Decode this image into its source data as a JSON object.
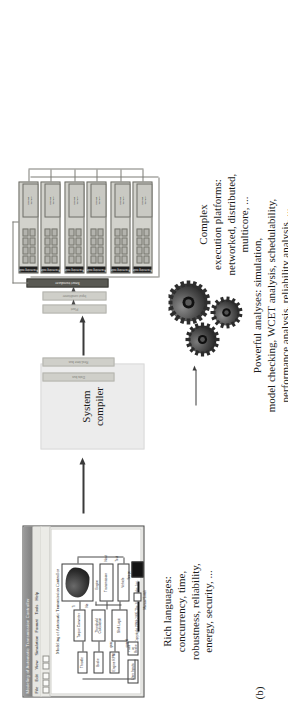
{
  "figure": {
    "caption": "(b)",
    "notes": {
      "languages": "Rich languages:\nconcurrency, time,\nrobustness, reliability,\nenergy, security, ...",
      "platforms": "Complex\nexecution platforms:\nnetworked, distributed,\nmulticore, ...",
      "analyses": "Powerful analyses: simulation,\nmodel checking, WCET analysis, schedulability,\nperformance analysis, reliability analysis, ..."
    },
    "compiler": {
      "label": "System\ncompiler"
    },
    "arrows": {
      "model_to_compiler": "arrow-right",
      "compiler_to_platform": "arrow-right",
      "compiler_to_gears": "arrow-right"
    }
  },
  "model_window": {
    "title": "Modeling of Automatic Transmission Controller",
    "menus": [
      "File",
      "Edit",
      "View",
      "Simulation",
      "Format",
      "Tools",
      "Help"
    ],
    "model_title": "Modeling of Automatic Transmission Controller",
    "footer": "Copyright 1990-2005 The MathWorks, Inc.",
    "blocks": [
      {
        "label": "Engine RPM"
      },
      {
        "label": "Throttle"
      },
      {
        "label": "Brake"
      },
      {
        "label": "Engine"
      },
      {
        "label": "Torque Converter"
      },
      {
        "label": "Transmission"
      },
      {
        "label": "Vehicle"
      },
      {
        "label": "Shift Logic"
      },
      {
        "label": "Threshold Calculation"
      },
      {
        "label": "Gear"
      },
      {
        "label": "Speed"
      },
      {
        "label": "Output Shaft"
      },
      {
        "label": "Impeller torque"
      },
      {
        "label": "Vehicle Speed"
      },
      {
        "label": "Manual Switch"
      },
      {
        "label": "Scope"
      },
      {
        "label": "Pass or Brake"
      },
      {
        "label": "User Inputs"
      }
    ],
    "annotations": [
      "Ti",
      "Ne",
      "Nout",
      "Tout",
      "gear",
      "speed"
    ]
  },
  "platform": {
    "side_bars": [
      {
        "label": "Plant",
        "style": "light"
      },
      {
        "label": "Input conditioner",
        "style": "light"
      },
      {
        "label": "Smart transducer",
        "style": "dark"
      }
    ],
    "right_bars": [
      {
        "label": "Data bus",
        "style": "light"
      },
      {
        "label": "Real-time bus",
        "style": "light"
      }
    ],
    "nodes": [
      {
        "label": "Processing node"
      },
      {
        "label": "Processing node"
      },
      {
        "label": "Processing node"
      },
      {
        "label": "Processing node"
      },
      {
        "label": "Processing node"
      },
      {
        "label": "Processing node"
      },
      {
        "label": "Processing node"
      },
      {
        "label": "Processing node"
      }
    ],
    "memory_label": "Shared\nmemory"
  },
  "colors": {
    "background": "#ffffff",
    "text": "#1b1b1b",
    "compiler_fill": "#ececec",
    "node_fill": "#d2d2cc",
    "node_strip": "#1f1f1f",
    "bar_fill": "#b0b0aa",
    "arrow": "#3a3a3a"
  }
}
